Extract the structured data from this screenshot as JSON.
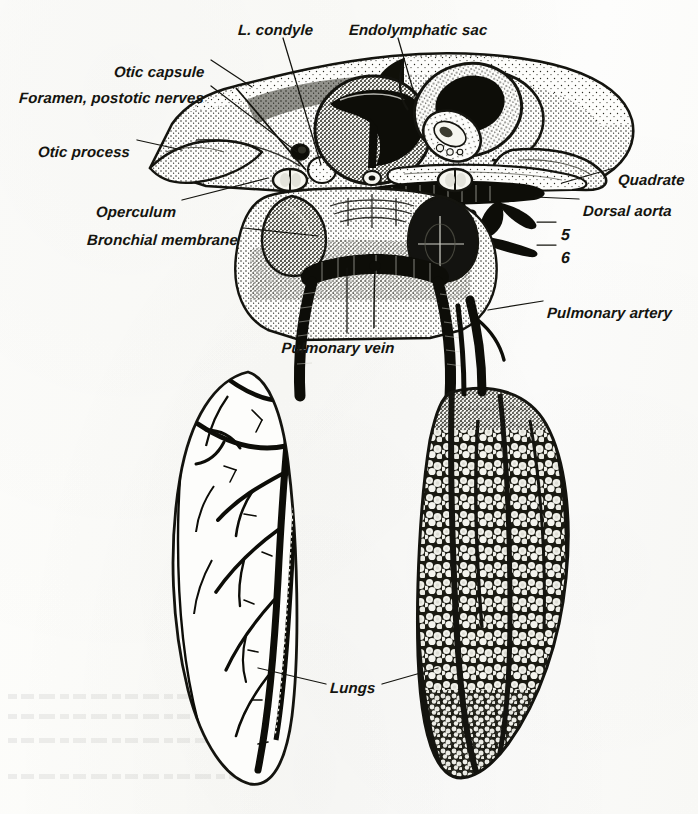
{
  "figure": {
    "kind": "anatomical-illustration",
    "style": "stippled pen-and-ink halftone engraving on aged paper",
    "background_color": "#fdfdfb",
    "ink_color": "#14140f"
  },
  "labels": [
    {
      "id": "l-condyle",
      "text": "L. condyle",
      "x": 238,
      "y": 22,
      "align": "left"
    },
    {
      "id": "endolymphatic-sac",
      "text": "Endolymphatic sac",
      "x": 349,
      "y": 22,
      "align": "left"
    },
    {
      "id": "otic-capsule",
      "text": "Otic capsule",
      "x": 204,
      "y": 64,
      "align": "right"
    },
    {
      "id": "foramen-postotic",
      "text": "Foramen, postotic nerves",
      "x": 204,
      "y": 90,
      "align": "right"
    },
    {
      "id": "otic-process",
      "text": "Otic process",
      "x": 130,
      "y": 144,
      "align": "right"
    },
    {
      "id": "quadrate",
      "text": "Quadrate",
      "x": 618,
      "y": 172,
      "align": "left"
    },
    {
      "id": "dorsal-aorta",
      "text": "Dorsal aorta",
      "x": 583,
      "y": 203,
      "align": "left"
    },
    {
      "id": "aortic-arch-5",
      "text": "5",
      "x": 561,
      "y": 226,
      "align": "left"
    },
    {
      "id": "aortic-arch-6",
      "text": "6",
      "x": 561,
      "y": 249,
      "align": "left"
    },
    {
      "id": "operculum",
      "text": "Operculum",
      "x": 176,
      "y": 204,
      "align": "right"
    },
    {
      "id": "bronchial-membrane",
      "text": "Bronchial membrane",
      "x": 238,
      "y": 232,
      "align": "right"
    },
    {
      "id": "pulmonary-artery",
      "text": "Pulmonary artery",
      "x": 547,
      "y": 305,
      "align": "left"
    },
    {
      "id": "pulmonary-vein",
      "text": "Pulmonary vein",
      "x": 338,
      "y": 340,
      "align": "center"
    },
    {
      "id": "lungs",
      "text": "Lungs",
      "x": 330,
      "y": 680,
      "align": "left"
    }
  ],
  "leader_lines": [
    {
      "id": "leader-l-condyle",
      "from": [
        283,
        38
      ],
      "to": [
        321,
        165
      ]
    },
    {
      "id": "leader-endolymphatic-sac",
      "from": [
        398,
        38
      ],
      "to": [
        416,
        100
      ]
    },
    {
      "id": "leader-otic-capsule",
      "from": [
        211,
        60
      ],
      "to": [
        252,
        87
      ]
    },
    {
      "id": "leader-foramen-postotic",
      "from": [
        211,
        86
      ],
      "to": [
        297,
        152
      ]
    },
    {
      "id": "leader-otic-process",
      "from": [
        137,
        140
      ],
      "to": [
        182,
        150
      ]
    },
    {
      "id": "leader-quadrate",
      "from": [
        614,
        168
      ],
      "to": [
        562,
        183
      ]
    },
    {
      "id": "leader-dorsal-aorta",
      "from": [
        579,
        199
      ],
      "to": [
        535,
        197
      ]
    },
    {
      "id": "leader-arch-5",
      "from": [
        556,
        222
      ],
      "to": [
        537,
        222
      ]
    },
    {
      "id": "leader-arch-6",
      "from": [
        556,
        245
      ],
      "to": [
        537,
        245
      ]
    },
    {
      "id": "leader-operculum",
      "from": [
        182,
        200
      ],
      "to": [
        268,
        178
      ]
    },
    {
      "id": "leader-bronchial-membrane",
      "from": [
        244,
        228
      ],
      "to": [
        318,
        236
      ]
    },
    {
      "id": "leader-pulmonary-artery",
      "from": [
        543,
        301
      ],
      "to": [
        488,
        310
      ]
    },
    {
      "id": "leader-pulmonary-vein",
      "from": [
        347,
        333
      ],
      "to": [
        347,
        268
      ]
    },
    {
      "id": "leader-lungs-left",
      "from": [
        326,
        684
      ],
      "to": [
        258,
        668
      ]
    },
    {
      "id": "leader-lungs-right",
      "from": [
        382,
        684
      ],
      "to": [
        438,
        668
      ]
    }
  ],
  "structures": [
    {
      "id": "skull-otic-region",
      "name": "Otic capsule / braincase block",
      "shading": "dense stipple"
    },
    {
      "id": "otic-process",
      "name": "Otic process (anterior spur)",
      "shading": "stipple"
    },
    {
      "id": "quadrate",
      "name": "Quadrate bone",
      "shading": "stipple"
    },
    {
      "id": "semicircular-canals",
      "name": "Semicircular canals",
      "shading": "solid black lumen"
    },
    {
      "id": "trachea",
      "name": "Trachea with cartilage rings",
      "shading": "solid black ladder"
    },
    {
      "id": "bronchus-left",
      "name": "Left bronchus",
      "shading": "solid black"
    },
    {
      "id": "bronchus-right",
      "name": "Right bronchus",
      "shading": "solid black"
    },
    {
      "id": "lung-left",
      "name": "Left lung (vessels shown)",
      "shading": "outline with branching vessels"
    },
    {
      "id": "lung-right",
      "name": "Right lung (alveoli shown)",
      "shading": "reticulate alveolar texture"
    },
    {
      "id": "aortic-arches",
      "name": "Aortic arches 5 and 6",
      "shading": "solid black"
    },
    {
      "id": "operculum",
      "name": "Operculum",
      "shading": "stipple"
    },
    {
      "id": "bronchial-membrane",
      "name": "Bronchial membrane sacs",
      "shading": "stipple"
    }
  ]
}
